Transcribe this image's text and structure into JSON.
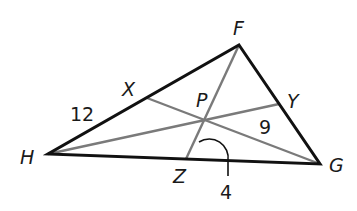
{
  "diagram": {
    "type": "triangle-with-concurrent-segments",
    "colors": {
      "sides": "#111111",
      "segments": "#7a7a7a",
      "background": "#ffffff"
    },
    "vertices": [
      {
        "name": "F",
        "label": "F"
      },
      {
        "name": "G",
        "label": "G"
      },
      {
        "name": "H",
        "label": "H"
      }
    ],
    "side_points": [
      {
        "name": "X",
        "label": "X",
        "on_side": "HF"
      },
      {
        "name": "Y",
        "label": "Y",
        "on_side": "FG"
      },
      {
        "name": "Z",
        "label": "Z",
        "on_side": "HG"
      }
    ],
    "intersection": {
      "name": "P",
      "label": "P"
    },
    "segments": [
      "FZ",
      "HY",
      "GX"
    ],
    "measure_labels": [
      {
        "label": "12",
        "refers_to": "HX"
      },
      {
        "label": "9",
        "refers_to": "PY"
      },
      {
        "label": "4",
        "refers_to": "arc / measure near Z"
      }
    ]
  }
}
